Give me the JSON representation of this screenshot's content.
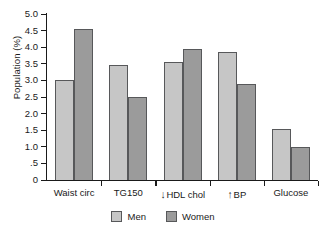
{
  "chart_data": {
    "type": "bar",
    "title": "",
    "xlabel": "",
    "ylabel": "Population (%)",
    "ylim": [
      0,
      5.0
    ],
    "grid": false,
    "legend_position": "bottom-center",
    "categories": [
      "Waist circ",
      "TG150",
      "HDL chol",
      "BP",
      "Glucose"
    ],
    "category_markers": [
      "",
      "",
      "↓",
      "↑",
      ""
    ],
    "series": [
      {
        "name": "Men",
        "color": "#c6c6c6",
        "values": [
          3.0,
          3.45,
          3.55,
          3.85,
          1.55
        ]
      },
      {
        "name": "Women",
        "color": "#9b9b9b",
        "values": [
          4.55,
          2.5,
          3.95,
          2.9,
          1.0
        ]
      }
    ],
    "y_ticks": [
      {
        "value": 5.0,
        "label": "5.0"
      },
      {
        "value": 4.5,
        "label": "4.5"
      },
      {
        "value": 4.0,
        "label": "4.0"
      },
      {
        "value": 3.5,
        "label": "3.5"
      },
      {
        "value": 3.0,
        "label": "3.0"
      },
      {
        "value": 2.5,
        "label": "2.5"
      },
      {
        "value": 2.0,
        "label": "2.0"
      },
      {
        "value": 1.5,
        "label": "1.5"
      },
      {
        "value": 1.0,
        "label": "1.0"
      },
      {
        "value": 0.5,
        "label": ".5"
      },
      {
        "value": 0.0,
        "label": "0"
      }
    ]
  },
  "axis": {
    "y_title": "Population (%)"
  },
  "legend": {
    "items": [
      {
        "label": "Men",
        "color": "#c6c6c6"
      },
      {
        "label": "Women",
        "color": "#9b9b9b"
      }
    ]
  },
  "colors": {
    "men_fill": "#c6c6c6",
    "women_fill": "#9b9b9b",
    "bar_stroke": "#57585a",
    "axis": "#1a1a1a",
    "background": "#ffffff"
  }
}
